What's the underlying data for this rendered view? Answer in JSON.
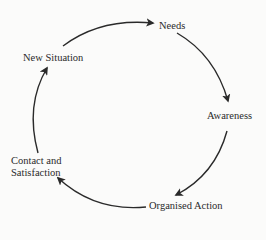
{
  "diagram": {
    "type": "cycle",
    "nodes": [
      {
        "id": "needs",
        "label": "Needs"
      },
      {
        "id": "awareness",
        "label": "Awareness"
      },
      {
        "id": "organised_action",
        "label": "Organised Action"
      },
      {
        "id": "contact_satisfaction",
        "label_line1": "Contact and",
        "label_line2": "Satisfaction"
      },
      {
        "id": "new_situation",
        "label": "New Situation"
      }
    ],
    "edges": [
      {
        "from": "new_situation",
        "to": "needs"
      },
      {
        "from": "needs",
        "to": "awareness"
      },
      {
        "from": "awareness",
        "to": "organised_action"
      },
      {
        "from": "organised_action",
        "to": "contact_satisfaction"
      },
      {
        "from": "contact_satisfaction",
        "to": "new_situation"
      }
    ],
    "colors": {
      "background": "#fbfbfa",
      "stroke": "#2a2a2a"
    }
  }
}
